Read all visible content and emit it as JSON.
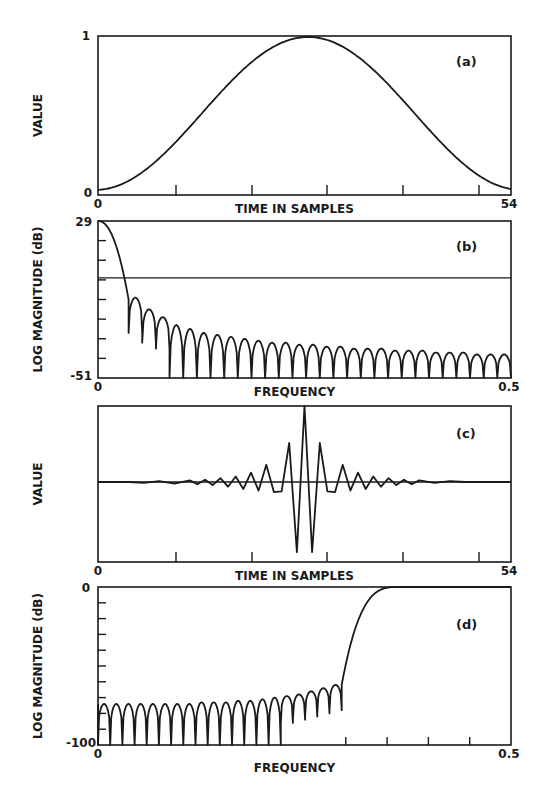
{
  "chart_data": [
    {
      "id": "a",
      "type": "line",
      "panel_label": "(a)",
      "title": "",
      "xlabel": "TIME IN SAMPLES",
      "ylabel": "VALUE",
      "x_tick_labels": [
        "0",
        "54"
      ],
      "y_tick_labels": [
        "0",
        "1"
      ],
      "xlim": [
        0,
        54
      ],
      "ylim": [
        0,
        1
      ],
      "grid": false,
      "description": "Raised-cosine (Hann-like) window",
      "x": [
        0,
        5,
        10,
        15,
        20,
        25,
        29,
        33,
        38,
        43,
        48,
        54
      ],
      "y": [
        0.02,
        0.1,
        0.3,
        0.57,
        0.82,
        0.97,
        1.0,
        0.96,
        0.78,
        0.5,
        0.22,
        0.02
      ]
    },
    {
      "id": "b",
      "type": "line",
      "panel_label": "(b)",
      "xlabel": "FREQUENCY",
      "ylabel": "LOG MAGNITUDE (dB)",
      "x_tick_labels": [
        "0",
        "0.5"
      ],
      "y_tick_labels": [
        "29",
        "-51"
      ],
      "xlim": [
        0,
        0.5
      ],
      "ylim": [
        -51,
        29
      ],
      "grid": false,
      "reference_line_db": 0,
      "description": "Log magnitude of window spectrum: main lobe then decaying sidelobes",
      "mainlobe_peak_db": 29,
      "first_null_freq": 0.037,
      "sidelobe_peaks_db": [
        -10,
        -16,
        -20,
        -24,
        -26,
        -28,
        -29,
        -30,
        -31,
        -32,
        -33,
        -33,
        -34,
        -34,
        -35,
        -35,
        -36,
        -36,
        -36,
        -37,
        -37,
        -37,
        -38,
        -38,
        -38,
        -39,
        -39,
        -39
      ],
      "sidelobe_count": 28
    },
    {
      "id": "c",
      "type": "line",
      "panel_label": "(c)",
      "xlabel": "TIME IN SAMPLES",
      "ylabel": "VALUE",
      "x_tick_labels": [
        "0",
        "54"
      ],
      "xlim": [
        0,
        54
      ],
      "grid": false,
      "description": "Windowed ideal highpass impulse response centered near sample 27",
      "x": [
        0,
        2,
        4,
        6,
        8,
        10,
        12,
        13,
        14,
        15,
        16,
        17,
        18,
        19,
        20,
        21,
        22,
        23,
        24,
        25,
        26,
        27,
        28,
        29,
        30,
        31,
        32,
        33,
        34,
        35,
        36,
        37,
        38,
        39,
        40,
        41,
        42,
        44,
        46,
        48,
        50,
        52,
        54
      ],
      "y": [
        0,
        0,
        0,
        -0.01,
        0.01,
        -0.02,
        0.02,
        -0.03,
        0.03,
        -0.04,
        0.05,
        -0.06,
        0.07,
        -0.09,
        0.12,
        -0.11,
        0.22,
        -0.13,
        -0.12,
        0.5,
        -0.9,
        1.0,
        -0.9,
        0.5,
        -0.12,
        -0.13,
        0.22,
        -0.11,
        0.12,
        -0.09,
        0.07,
        -0.06,
        0.05,
        -0.04,
        0.03,
        -0.03,
        0.02,
        -0.01,
        0.01,
        0,
        0,
        0,
        0
      ]
    },
    {
      "id": "d",
      "type": "line",
      "panel_label": "(d)",
      "xlabel": "FREQUENCY",
      "ylabel": "LOG MAGNITUDE (dB)",
      "x_tick_labels": [
        "0",
        "0.5"
      ],
      "y_tick_labels": [
        "0",
        "-100"
      ],
      "xlim": [
        0,
        0.5
      ],
      "ylim": [
        -100,
        0
      ],
      "grid": false,
      "description": "Highpass filter log magnitude response; stopband ripples then transition to 0 dB passband",
      "stopband_edge_freq": 0.295,
      "passband_start_freq": 0.365,
      "stopband_lobe_peaks_db": [
        -74,
        -74,
        -74,
        -74,
        -74,
        -74,
        -74,
        -74,
        -73,
        -73,
        -73,
        -72,
        -72,
        -71,
        -70,
        -69,
        -68,
        -66,
        -64,
        -62
      ],
      "stopband_lobe_count": 20
    }
  ]
}
